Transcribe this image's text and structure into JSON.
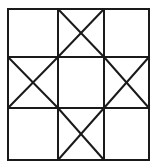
{
  "figure": {
    "stroke_color": "#1a1a1a",
    "background": "#ffffff",
    "grid": {
      "cols_x": [
        8,
        58,
        104,
        149
      ],
      "rows_y": [
        9,
        57,
        108,
        160
      ]
    },
    "cells": [
      {
        "row": 0,
        "col": 0,
        "x_mark": false
      },
      {
        "row": 0,
        "col": 1,
        "x_mark": true
      },
      {
        "row": 0,
        "col": 2,
        "x_mark": false
      },
      {
        "row": 1,
        "col": 0,
        "x_mark": true
      },
      {
        "row": 1,
        "col": 1,
        "x_mark": false
      },
      {
        "row": 1,
        "col": 2,
        "x_mark": true
      },
      {
        "row": 2,
        "col": 0,
        "x_mark": false
      },
      {
        "row": 2,
        "col": 1,
        "x_mark": true
      },
      {
        "row": 2,
        "col": 2,
        "x_mark": false
      }
    ]
  }
}
